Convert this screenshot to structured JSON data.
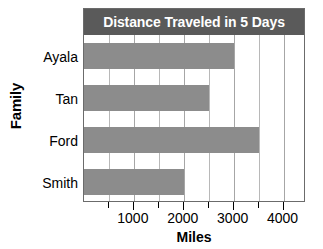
{
  "chart_data": {
    "type": "bar",
    "orientation": "horizontal",
    "title": "Distance Traveled in 5 Days",
    "xlabel": "Miles",
    "ylabel": "Family",
    "categories": [
      "Ayala",
      "Tan",
      "Ford",
      "Smith"
    ],
    "values": [
      3000,
      2500,
      3500,
      2000
    ],
    "series": [
      {
        "name": "Distance Traveled",
        "values": [
          3000,
          2500,
          3500,
          2000
        ]
      }
    ],
    "xlim": [
      0,
      4450
    ],
    "xticks": [
      1000,
      2000,
      3000,
      4000
    ],
    "xtick_labels": [
      "1000",
      "2000",
      "3000",
      "4000"
    ],
    "minor_xticks": [
      500,
      1500,
      2500,
      3500
    ],
    "gridlines": [
      500,
      1000,
      1500,
      2000,
      2500,
      3000,
      3500,
      4000
    ],
    "grid": true,
    "legend": false,
    "legend_position": "none",
    "bar_color": "#8c8c8c",
    "title_bar_color": "#5a5a5a",
    "title_text_color": "#ffffff",
    "gridline_color": "#b8b8b8",
    "frame_color": "#6b6b6b",
    "background_color": "#ffffff",
    "text_color": "#000000"
  }
}
